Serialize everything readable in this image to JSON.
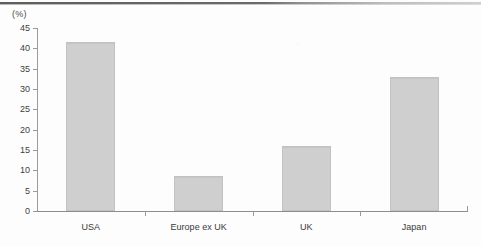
{
  "chart_data": {
    "type": "bar",
    "title": "",
    "xlabel": "",
    "ylabel": "(%)",
    "unit_label": "(%)",
    "categories": [
      "USA",
      "Europe ex UK",
      "UK",
      "Japan"
    ],
    "values": [
      41.5,
      8.5,
      16.0,
      33.0
    ],
    "ylim": [
      0,
      45
    ],
    "ytick_step": 5,
    "yticks": [
      45,
      40,
      35,
      30,
      25,
      20,
      15,
      10,
      5,
      0
    ],
    "ytick_labels": [
      "45",
      "40",
      "35",
      "30",
      "25",
      "20",
      "15",
      "10",
      "5",
      "0"
    ],
    "grid": false,
    "legend": false,
    "bar_color": "#cfcfcf",
    "bar_border_color": "#c2c2c2",
    "axis_color": "#9a9a9a",
    "text_color": "#3d3d3d"
  }
}
